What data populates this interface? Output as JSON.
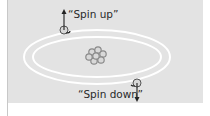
{
  "diagram": {
    "labels": {
      "spin_up": "“Spin up”",
      "spin_down": "“Spin down”"
    },
    "elements": {
      "nucleus": "nucleus-cluster-icon",
      "orbits": [
        "outer-orbit",
        "inner-orbit"
      ],
      "electrons": [
        {
          "name": "spin-up-electron",
          "arrow": "up-arrow-icon"
        },
        {
          "name": "spin-down-electron",
          "arrow": "down-arrow-icon"
        }
      ]
    },
    "colors": {
      "panel": "#e3e3e3",
      "orbit": "#ffffff",
      "nucleus": "#8a8a8a",
      "text": "#2a2a2a"
    }
  }
}
